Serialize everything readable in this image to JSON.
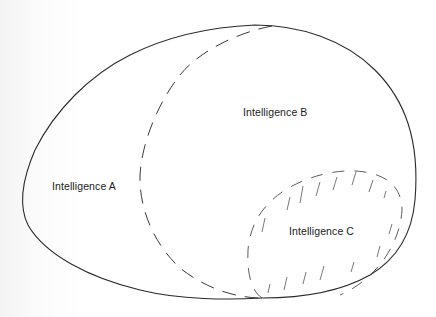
{
  "diagram": {
    "type": "overlapping-regions",
    "regions": [
      {
        "id": "A",
        "label": "Intelligence A",
        "line_style": "solid",
        "description": "Outer egg-shaped boundary"
      },
      {
        "id": "B",
        "label": "Intelligence B",
        "line_style": "dashed",
        "description": "Right portion bounded by dashed curve"
      },
      {
        "id": "C",
        "label": "Intelligence C",
        "line_style": "dashed-hatched",
        "description": "Hatched oval in lower right"
      }
    ],
    "colors": {
      "stroke": "#2a2a2a",
      "background": "#ffffff",
      "text": "#1a1a1a"
    }
  }
}
